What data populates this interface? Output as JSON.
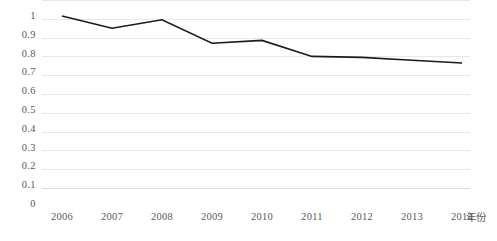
{
  "chart_data": {
    "type": "line",
    "title": "",
    "xlabel": "年份",
    "ylabel": "",
    "categories": [
      "2006",
      "2007",
      "2008",
      "2009",
      "2010",
      "2011",
      "2012",
      "2013",
      "2014"
    ],
    "x": [
      2006,
      2007,
      2008,
      2009,
      2010,
      2011,
      2012,
      2013,
      2014
    ],
    "series": [
      {
        "name": "",
        "values": [
          1.0,
          0.935,
          0.98,
          0.855,
          0.87,
          0.785,
          0.78,
          0.765,
          0.75
        ]
      }
    ],
    "ylim": [
      0,
      1
    ],
    "ytick_step": 0.1,
    "ytick_labels": [
      "1",
      "0.9",
      "0.8",
      "0.7",
      "0.6",
      "0.5",
      "0.4",
      "0.3",
      "0.2",
      "0.1",
      "0"
    ],
    "ytick_values": [
      1,
      0.9,
      0.8,
      0.7,
      0.6,
      0.5,
      0.4,
      0.3,
      0.2,
      0.1,
      0
    ],
    "grid": true,
    "grid_axis": "y",
    "legend": false,
    "legend_position": "none",
    "markers": false,
    "colors": {
      "line": "#1a1a1a",
      "grid": "#e8e8e8",
      "axis": "#d9d9d9",
      "text": "#595959",
      "background": "#ffffff"
    }
  }
}
